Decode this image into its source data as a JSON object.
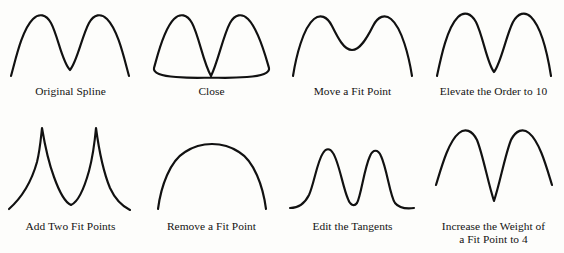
{
  "figure": {
    "background_color": "#fdfdfb",
    "curve_color": "#111111",
    "caption_color": "#131313",
    "columns": 4,
    "rows": 2
  },
  "panels": [
    {
      "id": "original-spline",
      "caption": "Original Spline",
      "row": 1,
      "column": 1,
      "shape": "two rounded peaks with deep rounded central valley",
      "curve_color": "#111111",
      "closed": false
    },
    {
      "id": "close",
      "caption": "Close",
      "row": 1,
      "column": 2,
      "shape": "closed loop: two peaks meeting at a bottom cusp with closing arc",
      "curve_color": "#111111",
      "closed": true
    },
    {
      "id": "move-a-fit-point",
      "caption": "Move a Fit Point",
      "row": 1,
      "column": 3,
      "shape": "two rounded peaks with shallow central valley",
      "curve_color": "#111111",
      "closed": false
    },
    {
      "id": "elevate-the-order-to-10",
      "caption": "Elevate the Order to 10",
      "row": 1,
      "column": 4,
      "shape": "two rounded peaks with deep rounded central valley",
      "curve_color": "#111111",
      "closed": false
    },
    {
      "id": "add-two-fit-points",
      "caption": "Add Two Fit Points",
      "row": 2,
      "column": 1,
      "shape": "two sharp cusped peaks with concave flanks and rounded valley",
      "curve_color": "#111111",
      "closed": false
    },
    {
      "id": "remove-a-fit-point",
      "caption": "Remove a Fit Point",
      "row": 2,
      "column": 2,
      "shape": "single broad flattened arch",
      "curve_color": "#111111",
      "closed": false
    },
    {
      "id": "edit-the-tangents",
      "caption": "Edit the Tangents",
      "row": 2,
      "column": 3,
      "shape": "two narrow bell peaks with flat tails and flat valley",
      "curve_color": "#111111",
      "closed": false
    },
    {
      "id": "increase-the-weight-of-a-fit-point-to-4",
      "caption": "Increase the Weight of\na Fit Point to 4",
      "row": 2,
      "column": 4,
      "shape": "two rounded peaks with deep sharp V valley",
      "curve_color": "#111111",
      "closed": false
    }
  ]
}
